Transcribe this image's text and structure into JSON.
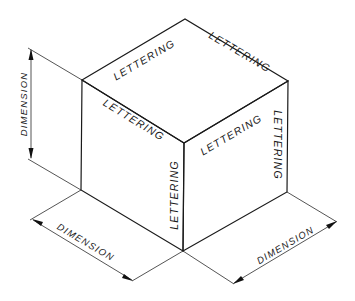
{
  "figure": {
    "title": "",
    "type": "isometric cube with lettering and dimension lines",
    "colors": {
      "line": "#1a1a1a",
      "background": "#ffffff"
    }
  },
  "cube": {
    "top_face": {
      "labels": [
        "LETTERING",
        "LETTERING"
      ]
    },
    "left_face": {
      "labels": [
        "LETTERING",
        "LETTERING"
      ]
    },
    "right_face": {
      "labels": [
        "LETTERING",
        "LETTERING"
      ]
    }
  },
  "dimensions": {
    "vertical": "DIMENSION",
    "left_bottom": "DIMENSION",
    "right_bottom": "DIMENSION"
  }
}
